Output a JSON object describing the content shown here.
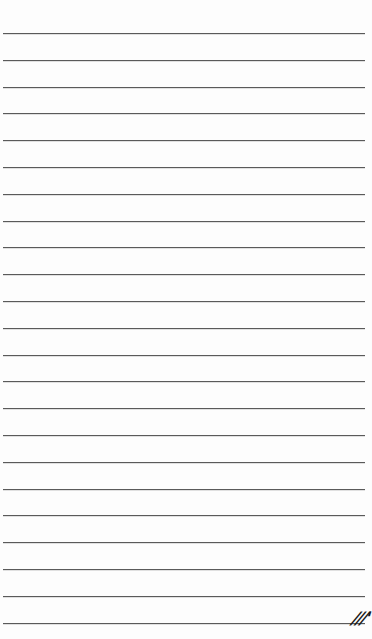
{
  "page": {
    "type": "lined-paper",
    "background_color": "#fdfdfd",
    "rule_color": "#5a5a5a",
    "rule_count": 23,
    "first_rule_y": 33,
    "rule_spacing": 26.8,
    "rule_left": 3,
    "rule_right": 365
  },
  "handwritten_mark": {
    "text": "///'",
    "position": "bottom-right"
  }
}
